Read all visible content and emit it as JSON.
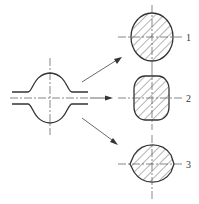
{
  "diagram": {
    "source_shape": "bulged tube section with centerlines",
    "sections": [
      {
        "label": "1",
        "shape": "oval (vertical ellipse), hatched"
      },
      {
        "label": "2",
        "shape": "rounded rectangle, hatched"
      },
      {
        "label": "3",
        "shape": "circle with flattened sides, hatched"
      }
    ],
    "colors": {
      "line": "#333333",
      "background": "#ffffff"
    }
  }
}
